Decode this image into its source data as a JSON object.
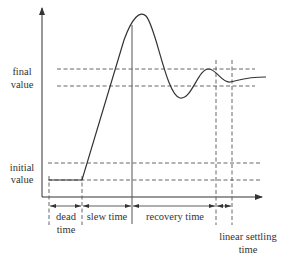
{
  "diagram": {
    "type": "step-response-settling-time",
    "y_labels": {
      "final_line1": "final",
      "final_line2": "value",
      "initial_line1": "initial",
      "initial_line2": "value"
    },
    "intervals": [
      {
        "label_line1": "dead",
        "label_line2": "time"
      },
      {
        "label_line1": "slew time",
        "label_line2": ""
      },
      {
        "label_line1": "recovery time",
        "label_line2": ""
      },
      {
        "label_line1": "linear settling",
        "label_line2": "time"
      }
    ],
    "colors": {
      "line": "#333333",
      "dashed": "#555555",
      "background": "#ffffff"
    }
  }
}
